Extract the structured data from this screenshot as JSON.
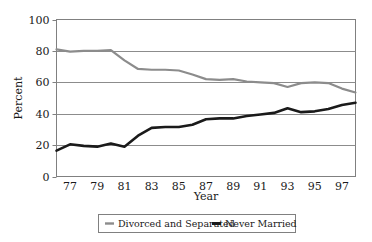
{
  "chart_data": {
    "type": "line",
    "title": "",
    "xlabel": "Year",
    "ylabel": "Percent",
    "xlim": [
      1976,
      1998
    ],
    "ylim": [
      0,
      100
    ],
    "grid": true,
    "legend_position": "bottom",
    "y_ticks": [
      "0",
      "20",
      "40",
      "60",
      "80",
      "100"
    ],
    "y_tick_values": [
      0,
      20,
      40,
      60,
      80,
      100
    ],
    "x_ticks": [
      "77",
      "79",
      "81",
      "83",
      "85",
      "87",
      "89",
      "91",
      "93",
      "95",
      "97"
    ],
    "x_tick_values": [
      1977,
      1979,
      1981,
      1983,
      1985,
      1987,
      1989,
      1991,
      1993,
      1995,
      1997
    ],
    "x": [
      1976,
      1977,
      1978,
      1979,
      1980,
      1981,
      1982,
      1983,
      1984,
      1985,
      1986,
      1987,
      1988,
      1989,
      1990,
      1991,
      1992,
      1993,
      1994,
      1995,
      1996,
      1997,
      1998
    ],
    "series": [
      {
        "name": "Divorced and Separated",
        "color": "#8c8c8c",
        "values": [
          81,
          79.5,
          80,
          80,
          80.5,
          74,
          68.5,
          68,
          68,
          67.5,
          65,
          62,
          61.5,
          62,
          60.5,
          60,
          59.5,
          57,
          59.5,
          60,
          59.5,
          56,
          53.5
        ]
      },
      {
        "name": "Never Married",
        "color": "#1a1a1a",
        "values": [
          16.5,
          20.5,
          19.5,
          19,
          21,
          19,
          26,
          31,
          31.5,
          31.5,
          33,
          36.5,
          37,
          37,
          38.5,
          39.5,
          40.5,
          43.5,
          41,
          41.5,
          43,
          45.5,
          47
        ]
      }
    ]
  },
  "legend": {
    "items": [
      {
        "label": "Divorced and Separated",
        "marker": "gray-line-marker"
      },
      {
        "label": "Never Married",
        "marker": "black-line-marker"
      }
    ]
  },
  "style": {
    "frame_color": "#808080",
    "grid_color": "#8c8c8c",
    "gray_series": "#8c8c8c",
    "black_series": "#1a1a1a",
    "text_color": "#1a1a1a",
    "background": "#ffffff"
  }
}
